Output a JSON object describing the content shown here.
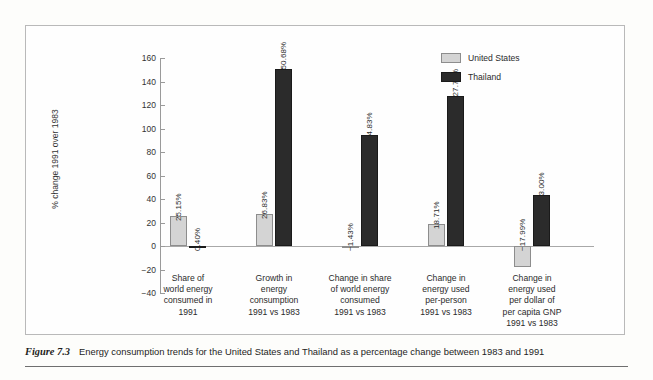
{
  "figure": {
    "caption_label": "Figure 7.3",
    "caption_text": "Energy consumption trends for the United States and Thailand as a percentage change between 1983 and 1991"
  },
  "colors": {
    "united_states": "#d4d4d4",
    "thailand": "#2b2b2b",
    "axis": "#9a9a9a",
    "frame": "#b9b9b9"
  },
  "chart_data": {
    "type": "bar",
    "title": "",
    "xlabel": "",
    "ylabel": "% change 1991 over 1983",
    "ylim": [
      -40,
      160
    ],
    "yticks": [
      -40,
      -20,
      0,
      20,
      40,
      60,
      80,
      100,
      120,
      140,
      160
    ],
    "ytick_labels": [
      "−40",
      "−20",
      "0",
      "20",
      "40",
      "60",
      "80",
      "100",
      "120",
      "140",
      "160"
    ],
    "grid": false,
    "legend_position": "top-right",
    "categories": [
      "Share of\nworld energy\nconsumed in\n1991",
      "Growth in\nenergy\nconsumption\n1991 vs 1983",
      "Change in share\nof world energy\nconsumed\n1991 vs 1983",
      "Change in\nenergy used\nper-person\n1991 vs 1983",
      "Change in\nenergy used\nper dollar of\nper capita GNP\n1991 vs 1983"
    ],
    "series": [
      {
        "name": "United States",
        "values": [
          25.15,
          26.83,
          -1.43,
          18.71,
          -17.99
        ],
        "labels": [
          "25.15%",
          "26.83%",
          "−1.43%",
          "18.71%",
          "−17.99%"
        ]
      },
      {
        "name": "Thailand",
        "values": [
          0.4,
          150.68,
          94.83,
          127.77,
          43.0
        ],
        "labels": [
          "0.40%",
          "150.68%",
          "94.83%",
          "127.77%",
          "43.00%"
        ]
      }
    ]
  }
}
